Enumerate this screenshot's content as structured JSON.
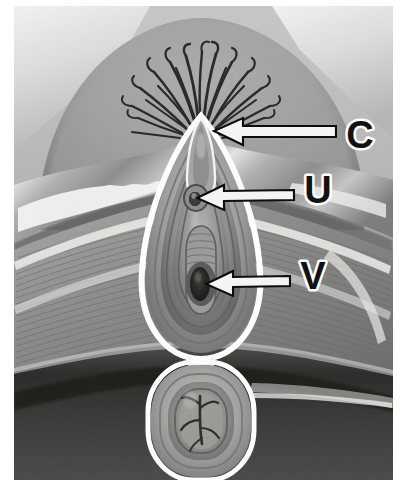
{
  "figure": {
    "type": "anatomical-illustration",
    "rendering": "grayscale medical airbrush illustration",
    "width": 403,
    "height": 486,
    "background_color": "#ffffff",
    "image_frame": {
      "x": 14,
      "y": 6,
      "width": 379,
      "height": 474,
      "border_color": "#ffffff"
    }
  },
  "labels": [
    {
      "id": "C",
      "text": "C",
      "meaning": "clitoris",
      "text_x": 360,
      "text_y": 138,
      "arrow_tip_x": 214,
      "arrow_tip_y": 131,
      "arrow_tail_x": 336,
      "arrow_tail_y": 131,
      "text_color": "#111111",
      "outline_color": "#ffffff"
    },
    {
      "id": "U",
      "text": "U",
      "meaning": "urethral opening",
      "text_x": 318,
      "text_y": 193,
      "arrow_tip_x": 197,
      "arrow_tip_y": 198,
      "arrow_tail_x": 294,
      "arrow_tail_y": 194,
      "text_color": "#111111",
      "outline_color": "#ffffff"
    },
    {
      "id": "V",
      "text": "V",
      "meaning": "vaginal opening",
      "text_x": 313,
      "text_y": 279,
      "arrow_tip_x": 206,
      "arrow_tip_y": 284,
      "arrow_tail_x": 290,
      "arrow_tail_y": 280,
      "text_color": "#111111",
      "outline_color": "#ffffff"
    }
  ],
  "anatomy_regions": [
    {
      "name": "left-thigh",
      "tone": "#9a9a9a"
    },
    {
      "name": "right-thigh",
      "tone": "#9a9a9a"
    },
    {
      "name": "mons-pubis",
      "tone": "#8e8e8e"
    },
    {
      "name": "pubic-hair",
      "tone": "#2a2a2a"
    },
    {
      "name": "labia-majora",
      "tone": "#b4b4b4"
    },
    {
      "name": "labia-minora",
      "tone": "#8a8a8a"
    },
    {
      "name": "clitoral-hood",
      "tone": "#a6a6a6"
    },
    {
      "name": "urethral-opening",
      "tone": "#4a4a4a"
    },
    {
      "name": "vaginal-introitus",
      "tone": "#3c3c3c"
    },
    {
      "name": "perineum",
      "tone": "#8f8f8f"
    },
    {
      "name": "anus",
      "tone": "#5a5a5a"
    },
    {
      "name": "buttock-shadow",
      "tone": "#3a3a3a"
    }
  ],
  "palette": {
    "highlight": "#f0f0ee",
    "light_gray": "#c9c9c9",
    "mid_gray": "#959595",
    "dark_gray": "#5b5b5b",
    "shadow": "#2e2e2e",
    "near_black": "#141414",
    "outline_white": "#ffffff"
  }
}
